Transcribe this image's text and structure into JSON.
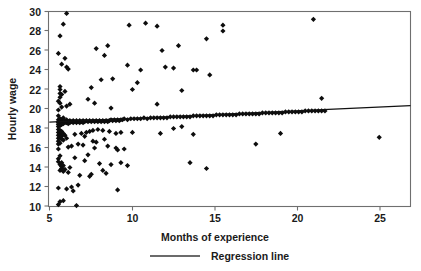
{
  "chart_data": {
    "type": "scatter",
    "title": "",
    "xlabel": "Months of experience",
    "ylabel": "Hourly wage",
    "xlim": [
      4.4,
      26.4
    ],
    "ylim": [
      10,
      30
    ],
    "xticks": [
      5,
      10,
      15,
      20,
      25
    ],
    "yticks": [
      10,
      12,
      14,
      16,
      18,
      20,
      22,
      24,
      26,
      28,
      30
    ],
    "grid": false,
    "legend": {
      "position": "bottom-center",
      "entries": [
        {
          "label": "Regression line",
          "marker": "line",
          "color": "#3a3a3a"
        }
      ]
    },
    "series": [
      {
        "name": "Observations",
        "marker": "diamond",
        "color": "#0d0d0d",
        "points": [
          [
            5.0,
            25.7
          ],
          [
            5.0,
            20.8
          ],
          [
            5.0,
            19.9
          ],
          [
            5.0,
            19.3
          ],
          [
            5.0,
            18.9
          ],
          [
            5.0,
            18.7
          ],
          [
            5.0,
            18.6
          ],
          [
            5.0,
            18.4
          ],
          [
            5.0,
            18.2
          ],
          [
            5.0,
            17.9
          ],
          [
            5.0,
            17.6
          ],
          [
            5.0,
            17.3
          ],
          [
            5.0,
            17.0
          ],
          [
            5.0,
            16.7
          ],
          [
            5.0,
            16.4
          ],
          [
            5.0,
            15.9
          ],
          [
            5.0,
            14.9
          ],
          [
            5.0,
            14.6
          ],
          [
            5.0,
            11.9
          ],
          [
            5.0,
            10.2
          ],
          [
            5.1,
            27.5
          ],
          [
            5.1,
            22.3
          ],
          [
            5.1,
            22.0
          ],
          [
            5.1,
            21.6
          ],
          [
            5.1,
            21.2
          ],
          [
            5.1,
            20.6
          ],
          [
            5.1,
            19.0
          ],
          [
            5.1,
            18.8
          ],
          [
            5.1,
            18.5
          ],
          [
            5.1,
            18.3
          ],
          [
            5.1,
            17.8
          ],
          [
            5.1,
            17.4
          ],
          [
            5.1,
            17.1
          ],
          [
            5.1,
            16.5
          ],
          [
            5.1,
            15.2
          ],
          [
            5.1,
            14.3
          ],
          [
            5.1,
            13.7
          ],
          [
            5.1,
            10.5
          ],
          [
            5.2,
            24.6
          ],
          [
            5.2,
            21.5
          ],
          [
            5.2,
            20.2
          ],
          [
            5.2,
            18.9
          ],
          [
            5.2,
            18.6
          ],
          [
            5.2,
            18.4
          ],
          [
            5.2,
            17.7
          ],
          [
            5.2,
            17.2
          ],
          [
            5.2,
            16.9
          ],
          [
            5.2,
            14.5
          ],
          [
            5.2,
            14.1
          ],
          [
            5.2,
            13.9
          ],
          [
            5.3,
            28.7
          ],
          [
            5.3,
            19.1
          ],
          [
            5.3,
            18.7
          ],
          [
            5.3,
            18.5
          ],
          [
            5.3,
            17.5
          ],
          [
            5.3,
            16.8
          ],
          [
            5.3,
            14.2
          ],
          [
            5.3,
            13.6
          ],
          [
            5.3,
            10.6
          ],
          [
            5.4,
            25.2
          ],
          [
            5.4,
            21.8
          ],
          [
            5.4,
            18.8
          ],
          [
            5.4,
            18.6
          ],
          [
            5.4,
            17.3
          ],
          [
            5.4,
            13.8
          ],
          [
            5.5,
            29.8
          ],
          [
            5.5,
            24.3
          ],
          [
            5.5,
            20.3
          ],
          [
            5.5,
            18.9
          ],
          [
            5.5,
            18.6
          ],
          [
            5.5,
            17.0
          ],
          [
            5.5,
            11.8
          ],
          [
            5.6,
            24.1
          ],
          [
            5.6,
            18.7
          ],
          [
            5.6,
            18.5
          ],
          [
            5.6,
            16.1
          ],
          [
            5.6,
            13.5
          ],
          [
            5.7,
            20.5
          ],
          [
            5.7,
            18.8
          ],
          [
            5.7,
            18.6
          ],
          [
            5.7,
            14.0
          ],
          [
            5.8,
            18.7
          ],
          [
            5.8,
            16.2
          ],
          [
            5.8,
            12.0
          ],
          [
            5.9,
            18.8
          ],
          [
            5.9,
            18.6
          ],
          [
            5.9,
            11.6
          ],
          [
            6.0,
            18.7
          ],
          [
            6.0,
            17.4
          ],
          [
            6.0,
            15.0
          ],
          [
            6.1,
            18.8
          ],
          [
            6.1,
            18.6
          ],
          [
            6.1,
            10.1
          ],
          [
            6.2,
            18.7
          ],
          [
            6.2,
            16.4
          ],
          [
            6.3,
            18.8
          ],
          [
            6.3,
            18.6
          ],
          [
            6.3,
            13.2
          ],
          [
            6.4,
            18.7
          ],
          [
            6.4,
            17.5
          ],
          [
            6.5,
            18.8
          ],
          [
            6.5,
            18.6
          ],
          [
            6.5,
            16.3
          ],
          [
            6.6,
            18.7
          ],
          [
            6.6,
            14.7
          ],
          [
            6.7,
            18.8
          ],
          [
            6.7,
            17.6
          ],
          [
            6.8,
            18.7
          ],
          [
            6.8,
            15.3
          ],
          [
            6.9,
            18.8
          ],
          [
            6.9,
            17.7
          ],
          [
            7.0,
            18.7
          ],
          [
            7.0,
            22.2
          ],
          [
            7.0,
            13.3
          ],
          [
            7.1,
            18.8
          ],
          [
            7.1,
            17.8
          ],
          [
            7.2,
            18.7
          ],
          [
            7.2,
            16.0
          ],
          [
            7.3,
            18.8
          ],
          [
            7.3,
            26.2
          ],
          [
            7.4,
            18.7
          ],
          [
            7.4,
            17.9
          ],
          [
            7.5,
            18.8
          ],
          [
            7.5,
            14.4
          ],
          [
            7.6,
            18.7
          ],
          [
            7.6,
            23.0
          ],
          [
            7.7,
            18.8
          ],
          [
            7.7,
            17.8
          ],
          [
            7.8,
            18.7
          ],
          [
            7.8,
            25.5
          ],
          [
            7.9,
            18.8
          ],
          [
            7.9,
            13.4
          ],
          [
            8.0,
            18.7
          ],
          [
            8.0,
            26.5
          ],
          [
            8.1,
            18.8
          ],
          [
            8.1,
            17.7
          ],
          [
            8.2,
            18.9
          ],
          [
            8.2,
            14.3
          ],
          [
            8.3,
            18.8
          ],
          [
            8.3,
            23.1
          ],
          [
            8.4,
            18.9
          ],
          [
            8.5,
            18.8
          ],
          [
            8.5,
            16.0
          ],
          [
            8.6,
            18.9
          ],
          [
            8.6,
            11.7
          ],
          [
            8.7,
            18.8
          ],
          [
            8.8,
            18.9
          ],
          [
            8.8,
            17.6
          ],
          [
            8.9,
            18.9
          ],
          [
            9.0,
            19.0
          ],
          [
            9.0,
            15.9
          ],
          [
            9.2,
            18.9
          ],
          [
            9.4,
            19.0
          ],
          [
            9.5,
            22.0
          ],
          [
            9.6,
            19.0
          ],
          [
            9.8,
            19.0
          ],
          [
            10.0,
            19.0
          ],
          [
            10.2,
            19.1
          ],
          [
            10.4,
            19.0
          ],
          [
            10.6,
            19.1
          ],
          [
            10.8,
            19.1
          ],
          [
            11.0,
            19.1
          ],
          [
            11.0,
            28.5
          ],
          [
            11.0,
            20.5
          ],
          [
            11.2,
            19.1
          ],
          [
            11.4,
            19.1
          ],
          [
            11.5,
            24.3
          ],
          [
            11.6,
            19.1
          ],
          [
            11.8,
            19.2
          ],
          [
            12.0,
            19.2
          ],
          [
            12.0,
            24.2
          ],
          [
            12.2,
            19.2
          ],
          [
            12.4,
            19.2
          ],
          [
            12.5,
            21.9
          ],
          [
            12.6,
            19.2
          ],
          [
            12.8,
            19.2
          ],
          [
            13.0,
            19.2
          ],
          [
            13.0,
            14.5
          ],
          [
            13.2,
            19.3
          ],
          [
            13.4,
            19.3
          ],
          [
            13.6,
            19.3
          ],
          [
            13.8,
            19.3
          ],
          [
            14.0,
            19.3
          ],
          [
            14.0,
            13.9
          ],
          [
            14.2,
            19.3
          ],
          [
            14.4,
            19.3
          ],
          [
            14.6,
            19.4
          ],
          [
            14.8,
            19.4
          ],
          [
            15.0,
            19.4
          ],
          [
            15.2,
            19.4
          ],
          [
            15.4,
            19.4
          ],
          [
            15.6,
            19.4
          ],
          [
            15.8,
            19.4
          ],
          [
            16.0,
            19.5
          ],
          [
            16.2,
            19.5
          ],
          [
            16.4,
            19.5
          ],
          [
            16.6,
            19.5
          ],
          [
            16.8,
            19.5
          ],
          [
            17.0,
            19.5
          ],
          [
            17.0,
            16.4
          ],
          [
            17.2,
            19.5
          ],
          [
            17.4,
            19.6
          ],
          [
            17.6,
            19.6
          ],
          [
            17.8,
            19.6
          ],
          [
            18.0,
            19.6
          ],
          [
            18.2,
            19.6
          ],
          [
            18.4,
            19.6
          ],
          [
            18.5,
            17.5
          ],
          [
            18.6,
            19.6
          ],
          [
            18.8,
            19.7
          ],
          [
            19.0,
            19.7
          ],
          [
            19.2,
            19.7
          ],
          [
            19.4,
            19.7
          ],
          [
            19.6,
            19.7
          ],
          [
            19.8,
            19.7
          ],
          [
            20.0,
            19.8
          ],
          [
            20.2,
            19.8
          ],
          [
            20.4,
            19.8
          ],
          [
            20.5,
            29.2
          ],
          [
            20.6,
            19.8
          ],
          [
            20.8,
            19.8
          ],
          [
            21.0,
            19.8
          ],
          [
            9.3,
            28.6
          ],
          [
            10.3,
            28.8
          ],
          [
            9.2,
            24.5
          ],
          [
            10.0,
            24.0
          ],
          [
            11.3,
            26.0
          ],
          [
            12.3,
            26.5
          ],
          [
            13.2,
            24.0
          ],
          [
            13.4,
            24.0
          ],
          [
            14.0,
            27.2
          ],
          [
            14.2,
            23.5
          ],
          [
            15.0,
            28.0
          ],
          [
            15.0,
            28.6
          ],
          [
            9.8,
            22.7
          ],
          [
            8.2,
            20.1
          ],
          [
            7.2,
            20.6
          ],
          [
            6.8,
            21.0
          ],
          [
            12.0,
            18.0
          ],
          [
            12.5,
            18.2
          ],
          [
            11.2,
            17.5
          ],
          [
            13.2,
            17.4
          ],
          [
            9.5,
            17.6
          ],
          [
            8.5,
            17.5
          ],
          [
            7.8,
            16.9
          ],
          [
            6.6,
            17.2
          ],
          [
            7.1,
            16.7
          ],
          [
            7.3,
            16.6
          ],
          [
            8.0,
            16.2
          ],
          [
            8.6,
            15.8
          ],
          [
            9.2,
            14.2
          ],
          [
            8.8,
            14.5
          ],
          [
            7.7,
            13.7
          ],
          [
            6.9,
            13.1
          ],
          [
            6.2,
            12.2
          ],
          [
            24.5,
            17.1
          ],
          [
            21.0,
            21.1
          ],
          [
            21.2,
            19.8
          ]
        ]
      }
    ],
    "regression_line": {
      "label": "Regression line",
      "x": [
        4.45,
        26.4
      ],
      "y": [
        18.65,
        20.35
      ]
    }
  }
}
